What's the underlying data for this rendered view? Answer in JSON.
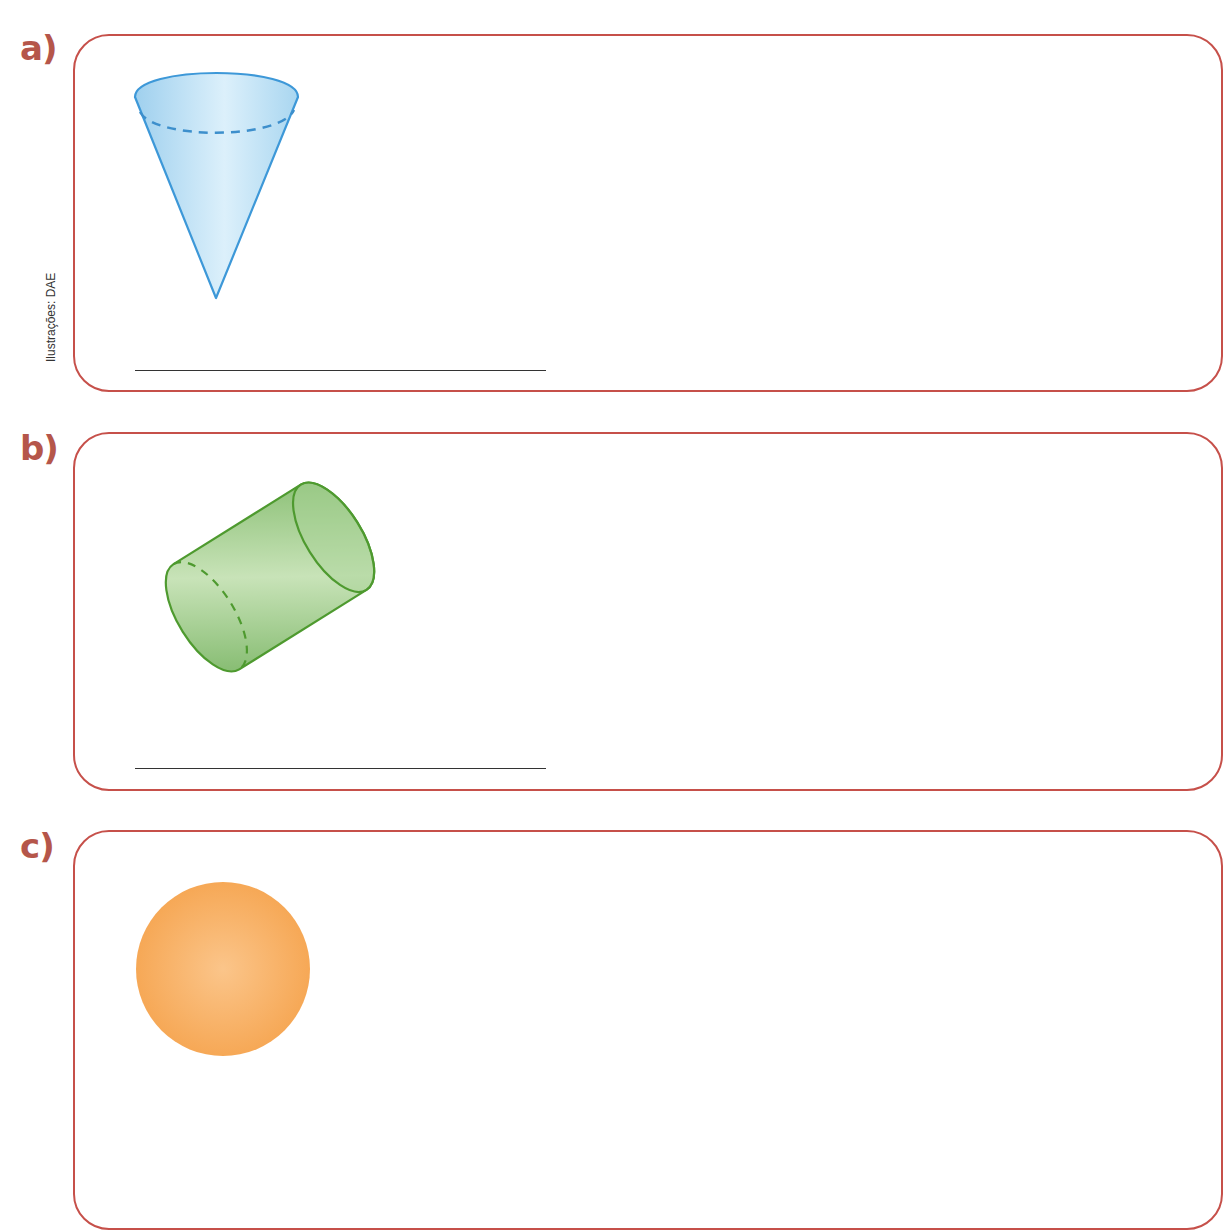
{
  "credit": "Ilustrações: DAE",
  "items": [
    {
      "label": "a)",
      "shape": "cone",
      "fill": "#b7def3",
      "stroke": "#3d98d8"
    },
    {
      "label": "b)",
      "shape": "cylinder",
      "fill": "#93c47d",
      "stroke": "#4e9a2f"
    },
    {
      "label": "c)",
      "shape": "sphere",
      "fill": "#f8b46a"
    }
  ],
  "colors": {
    "frame": "#c6504a",
    "label": "#b5564a",
    "answer_line": "#333333"
  }
}
